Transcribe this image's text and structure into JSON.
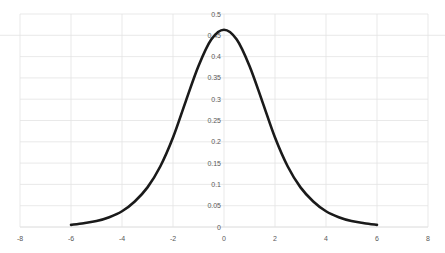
{
  "chart_data": {
    "type": "line",
    "title": "",
    "xlabel": "",
    "ylabel": "",
    "xlim": [
      -8,
      8
    ],
    "ylim": [
      0,
      0.5
    ],
    "grid": true,
    "legend": null,
    "x_ticks": [
      "-8",
      "-6",
      "-4",
      "-2",
      "0",
      "2",
      "4",
      "6",
      "8"
    ],
    "y_ticks": [
      "0",
      "0.05",
      "0.1",
      "0.15",
      "0.2",
      "0.25",
      "0.3",
      "0.35",
      "0.4",
      "0.45",
      "0.5"
    ],
    "series": [
      {
        "name": "density",
        "color": "#1a1a1a",
        "x": [
          -6,
          -5.5,
          -5,
          -4.5,
          -4,
          -3.5,
          -3,
          -2.5,
          -2,
          -1.5,
          -1,
          -0.5,
          0,
          0.5,
          1,
          1.5,
          2,
          2.5,
          3,
          3.5,
          4,
          4.5,
          5,
          5.5,
          6
        ],
        "y": [
          0.005,
          0.009,
          0.014,
          0.023,
          0.037,
          0.06,
          0.093,
          0.142,
          0.21,
          0.295,
          0.378,
          0.44,
          0.463,
          0.44,
          0.378,
          0.295,
          0.21,
          0.142,
          0.093,
          0.06,
          0.037,
          0.023,
          0.014,
          0.009,
          0.005
        ]
      }
    ]
  }
}
